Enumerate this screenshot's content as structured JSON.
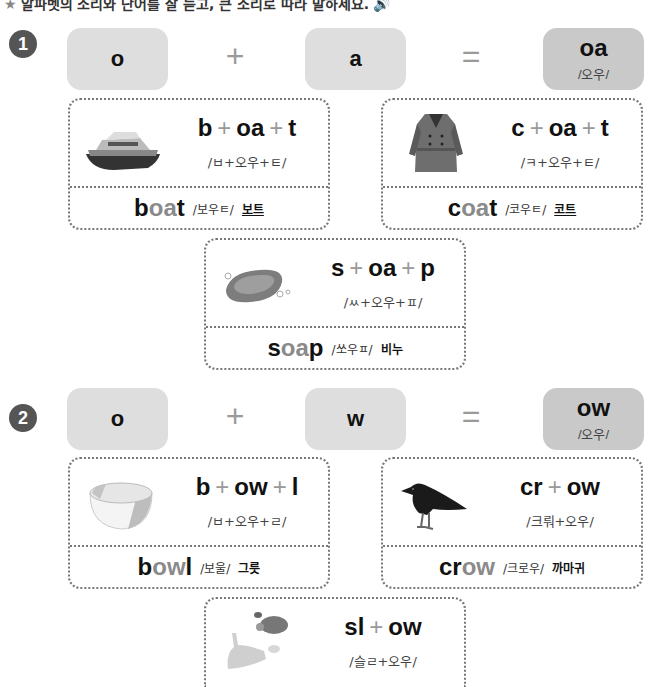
{
  "instruction": {
    "star": "★",
    "text": "알파벳의 소리와 단어를 잘 듣고, 큰 소리로 따라 말하세요.",
    "speaker_icon": "speaker-icon"
  },
  "sections": [
    {
      "number": "1",
      "letter1": "o",
      "plus": "+",
      "letter2": "a",
      "equals": "=",
      "result": "oa",
      "result_pron": "/오우/",
      "cards": [
        {
          "image": "boat-icon",
          "parts": [
            "b",
            "oa",
            "t"
          ],
          "pron": "/ㅂ+오우+ㅌ/",
          "word_pre": "b",
          "word_hl": "oa",
          "word_post": "t",
          "word_pron": "/보우ㅌ/",
          "meaning": "보트"
        },
        {
          "image": "coat-icon",
          "parts": [
            "c",
            "oa",
            "t"
          ],
          "pron": "/ㅋ+오우+ㅌ/",
          "word_pre": "c",
          "word_hl": "oa",
          "word_post": "t",
          "word_pron": "/코우ㅌ/",
          "meaning": "코트"
        },
        {
          "image": "soap-icon",
          "parts": [
            "s",
            "oa",
            "p"
          ],
          "pron": "/ㅆ+오우+ㅍ/",
          "word_pre": "s",
          "word_hl": "oa",
          "word_post": "p",
          "word_pron": "/쏘우ㅍ/",
          "meaning": "비누"
        }
      ]
    },
    {
      "number": "2",
      "letter1": "o",
      "plus": "+",
      "letter2": "w",
      "equals": "=",
      "result": "ow",
      "result_pron": "/오우/",
      "cards": [
        {
          "image": "bowl-icon",
          "parts": [
            "b",
            "ow",
            "l"
          ],
          "pron": "/ㅂ+오우+ㄹ/",
          "word_pre": "b",
          "word_hl": "ow",
          "word_post": "l",
          "word_pron": "/보울/",
          "meaning": "그릇"
        },
        {
          "image": "crow-icon",
          "parts": [
            "cr",
            "ow"
          ],
          "pron": "/크뤄+오우/",
          "word_pre": "cr",
          "word_hl": "ow",
          "word_post": "",
          "word_pron": "/크로우/",
          "meaning": "까마귀"
        },
        {
          "image": "rabbit-turtle-icon",
          "parts": [
            "sl",
            "ow"
          ],
          "pron": "/슬ㄹ+오우/"
        }
      ]
    }
  ]
}
